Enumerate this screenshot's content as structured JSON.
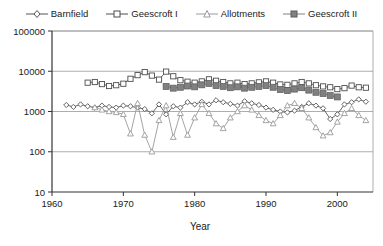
{
  "chart_data": {
    "type": "line",
    "title": "",
    "xlabel": "Year",
    "ylabel": "",
    "y_scale": "log",
    "ylim": [
      10,
      100000
    ],
    "xlim": [
      1960,
      2005
    ],
    "grid": true,
    "legend_position": "top",
    "y_ticks": [
      "100000",
      "10000",
      "1000",
      "100",
      "10"
    ],
    "x_ticks": [
      "1960",
      "1970",
      "1980",
      "1990",
      "2000"
    ],
    "series": [
      {
        "name": "Barnfield",
        "marker": "open-diamond",
        "color": "#555555",
        "x": [
          1962,
          1963,
          1964,
          1965,
          1966,
          1967,
          1968,
          1969,
          1970,
          1971,
          1972,
          1973,
          1974,
          1975,
          1976,
          1977,
          1978,
          1979,
          1980,
          1981,
          1982,
          1983,
          1984,
          1985,
          1986,
          1987,
          1988,
          1989,
          1990,
          1991,
          1992,
          1993,
          1994,
          1995,
          1996,
          1997,
          1998,
          1999,
          2000,
          2001,
          2002,
          2003,
          2004
        ],
        "values": [
          1450,
          1300,
          1500,
          1350,
          1250,
          1400,
          1300,
          1250,
          1400,
          1350,
          1250,
          1150,
          900,
          1500,
          850,
          1350,
          1250,
          1700,
          1500,
          1750,
          1500,
          1900,
          1700,
          1550,
          1400,
          1800,
          1600,
          1450,
          1250,
          1100,
          1000,
          950,
          1050,
          1300,
          1600,
          1400,
          1200,
          650,
          850,
          1500,
          1700,
          2000,
          1750
        ]
      },
      {
        "name": "Geescroft I",
        "marker": "open-square",
        "color": "#4d4d4d",
        "x": [
          1965,
          1966,
          1967,
          1968,
          1969,
          1970,
          1971,
          1972,
          1973,
          1974,
          1975,
          1976,
          1977,
          1978,
          1979,
          1980,
          1981,
          1982,
          1983,
          1984,
          1985,
          1986,
          1987,
          1988,
          1989,
          1990,
          1991,
          1992,
          1993,
          1994,
          1995,
          1996,
          1997,
          1998,
          1999,
          2000,
          2001,
          2002,
          2003,
          2004
        ],
        "values": [
          5200,
          5400,
          4800,
          4300,
          4500,
          4900,
          6500,
          8000,
          9500,
          7800,
          6200,
          9800,
          7500,
          6000,
          5500,
          5200,
          5600,
          6300,
          5800,
          5400,
          5000,
          5200,
          4800,
          5000,
          5300,
          5600,
          5200,
          4700,
          4600,
          5000,
          5400,
          5000,
          4500,
          4200,
          4000,
          3600,
          3800,
          4400,
          4000,
          3900
        ]
      },
      {
        "name": "Allotments",
        "marker": "open-triangle",
        "color": "#9a9a9a",
        "x": [
          1966,
          1967,
          1968,
          1969,
          1970,
          1971,
          1972,
          1973,
          1974,
          1975,
          1976,
          1977,
          1978,
          1979,
          1980,
          1981,
          1982,
          1983,
          1984,
          1985,
          1986,
          1987,
          1988,
          1989,
          1990,
          1991,
          1992,
          1993,
          1994,
          1995,
          1996,
          1997,
          1998,
          1999,
          2000,
          2001,
          2002,
          2003,
          2004
        ],
        "values": [
          1250,
          1100,
          1000,
          950,
          850,
          280,
          1600,
          260,
          100,
          600,
          1400,
          230,
          900,
          260,
          700,
          1500,
          900,
          500,
          380,
          700,
          1000,
          1400,
          1100,
          800,
          600,
          500,
          800,
          1400,
          1600,
          1200,
          700,
          400,
          250,
          300,
          550,
          900,
          1200,
          800,
          600
        ]
      },
      {
        "name": "Geescroft II",
        "marker": "filled-square",
        "color": "#808080",
        "x": [
          1976,
          1977,
          1978,
          1979,
          1980,
          1981,
          1982,
          1983,
          1984,
          1985,
          1986,
          1987,
          1988,
          1989,
          1990,
          1991,
          1992,
          1993,
          1994,
          1995,
          1996,
          1997,
          1998,
          1999,
          2000
        ],
        "values": [
          4200,
          3800,
          4000,
          4300,
          4100,
          4600,
          5000,
          4400,
          4200,
          3900,
          4100,
          3800,
          4000,
          4200,
          4400,
          4000,
          3500,
          3300,
          3600,
          3900,
          3400,
          3000,
          2800,
          2500,
          2300
        ]
      }
    ]
  },
  "legend": {
    "items": [
      {
        "label": "Barnfield",
        "marker": "open-diamond"
      },
      {
        "label": "Geescroft I",
        "marker": "open-square"
      },
      {
        "label": "Allotments",
        "marker": "open-triangle"
      },
      {
        "label": "Geescroft II",
        "marker": "filled-square"
      }
    ]
  },
  "axes": {
    "x_title": "Year"
  },
  "colors": {
    "barnfield": "#555555",
    "geescroft_i": "#4d4d4d",
    "allotments": "#9a9a9a",
    "geescroft_ii": "#808080",
    "axis": "#333333",
    "grid": "#999999"
  }
}
